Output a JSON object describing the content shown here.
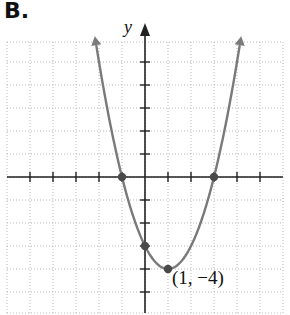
{
  "panel": {
    "label": "B."
  },
  "chart_data": {
    "type": "line",
    "title": "",
    "function": "f(x) = (x - 1)^2 - 4",
    "xlabel": "",
    "ylabel": "y",
    "xlim": [
      -6,
      6
    ],
    "ylim": [
      -6,
      6
    ],
    "grid": true,
    "grid_style": "dotted",
    "tick_step": 1,
    "x_axis_arrow": false,
    "y_axis_arrow": true,
    "curve_arrows": true,
    "series": [
      {
        "name": "parabola",
        "x": [
          -2.17,
          -2,
          -1.5,
          -1,
          -0.5,
          0,
          0.5,
          1,
          1.5,
          2,
          2.5,
          3,
          3.5,
          4,
          4.2
        ],
        "y": [
          6.04,
          5,
          2.25,
          0,
          -1.75,
          -3,
          -3.75,
          -4,
          -3.75,
          -3,
          -1.75,
          0,
          2.25,
          5,
          6.24
        ],
        "color": "#7a7a7a"
      }
    ],
    "points": [
      {
        "x": -1,
        "y": 0,
        "label": ""
      },
      {
        "x": 3,
        "y": 0,
        "label": ""
      },
      {
        "x": 0,
        "y": -3,
        "label": ""
      },
      {
        "x": 1,
        "y": -4,
        "label": "(1, −4)"
      }
    ],
    "annotations": [
      {
        "text": "(1, −4)",
        "x": 1,
        "y": -4
      }
    ],
    "colors": {
      "curve": "#7a7a7a",
      "points": "#4a4a4a",
      "axes": "#222222",
      "grid": "#b8b8b8"
    }
  }
}
